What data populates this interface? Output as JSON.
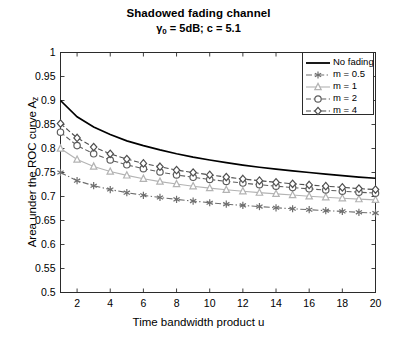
{
  "chart_data": {
    "type": "line",
    "title": "Shadowed fading channel",
    "subtitle_prefix": "γ",
    "subtitle_sub": "0",
    "subtitle_rest": " = 5dB; c = 5.1",
    "subtitle_plain": "γ0 = 5dB; c = 5.1",
    "xlabel": "Time bandwidth product u",
    "ylabel_main": "Area under the ROC curve A",
    "ylabel_sub": "z",
    "ylabel_plain": "Area under the ROC curve Az",
    "xlim": [
      1,
      20
    ],
    "ylim": [
      0.5,
      1
    ],
    "xticks": [
      2,
      4,
      6,
      8,
      10,
      12,
      14,
      16,
      18,
      20
    ],
    "xtick_labels": [
      "2",
      "4",
      "6",
      "8",
      "10",
      "12",
      "14",
      "16",
      "18",
      "20"
    ],
    "yticks": [
      0.5,
      0.55,
      0.6,
      0.65,
      0.7,
      0.75,
      0.8,
      0.85,
      0.9,
      0.95,
      1
    ],
    "ytick_labels": [
      "0.5",
      "0.55",
      "0.6",
      "0.65",
      "0.7",
      "0.75",
      "0.8",
      "0.85",
      "0.9",
      "0.95",
      "1"
    ],
    "grid": false,
    "legend_position": "top-right",
    "x": [
      1,
      2,
      3,
      4,
      5,
      6,
      7,
      8,
      9,
      10,
      11,
      12,
      13,
      14,
      15,
      16,
      17,
      18,
      19,
      20
    ],
    "series": [
      {
        "name": "No fading",
        "marker": "none",
        "linestyle": "solid",
        "color": "#000000",
        "values": [
          0.9,
          0.866,
          0.845,
          0.829,
          0.816,
          0.806,
          0.797,
          0.789,
          0.782,
          0.776,
          0.7705,
          0.7655,
          0.761,
          0.757,
          0.7535,
          0.75,
          0.7465,
          0.7435,
          0.7405,
          0.738
        ]
      },
      {
        "name": "m = 0.5",
        "marker": "star",
        "linestyle": "dashdot",
        "color": "#6e6e6e",
        "values": [
          0.75,
          0.733,
          0.7225,
          0.7145,
          0.708,
          0.7025,
          0.698,
          0.694,
          0.6905,
          0.687,
          0.684,
          0.6815,
          0.679,
          0.6765,
          0.6745,
          0.6725,
          0.6705,
          0.669,
          0.667,
          0.6655
        ]
      },
      {
        "name": "m = 1",
        "marker": "triangle",
        "linestyle": "solid",
        "color": "#b3b3b3",
        "values": [
          0.8,
          0.777,
          0.7625,
          0.752,
          0.744,
          0.737,
          0.731,
          0.726,
          0.7215,
          0.7175,
          0.714,
          0.711,
          0.708,
          0.7055,
          0.703,
          0.7005,
          0.6985,
          0.6965,
          0.6945,
          0.693
        ]
      },
      {
        "name": "m = 2",
        "marker": "circle",
        "linestyle": "dashed",
        "color": "#5e5e5e",
        "values": [
          0.834,
          0.806,
          0.789,
          0.776,
          0.766,
          0.758,
          0.751,
          0.745,
          0.74,
          0.7355,
          0.7315,
          0.728,
          0.7245,
          0.7215,
          0.7185,
          0.716,
          0.7135,
          0.711,
          0.709,
          0.707
        ]
      },
      {
        "name": "m = 4",
        "marker": "diamond",
        "linestyle": "dashed",
        "color": "#4f4f4f",
        "values": [
          0.852,
          0.822,
          0.803,
          0.789,
          0.778,
          0.769,
          0.762,
          0.755,
          0.75,
          0.745,
          0.7405,
          0.7365,
          0.733,
          0.7295,
          0.7265,
          0.724,
          0.7215,
          0.719,
          0.7165,
          0.7145
        ]
      }
    ]
  },
  "legend": {
    "entries": [
      {
        "label": "No fading"
      },
      {
        "label": "m = 0.5"
      },
      {
        "label": "m = 1"
      },
      {
        "label": "m = 2"
      },
      {
        "label": "m = 4"
      }
    ]
  },
  "colors": {
    "axis": "#2b2b2b",
    "background": "#ffffff",
    "text": "#000000"
  }
}
